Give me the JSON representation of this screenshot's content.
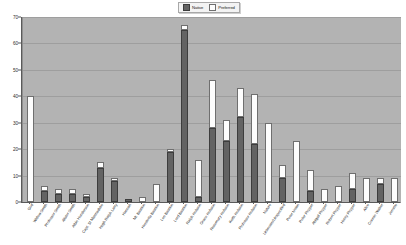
{
  "chart_data": {
    "type": "bar",
    "subtype": "stacked-vertical",
    "title": "",
    "xlabel": "",
    "ylabel": "",
    "ylim": [
      0,
      70
    ],
    "yticks": [
      0,
      10,
      20,
      30,
      40,
      50,
      60,
      70
    ],
    "grid": true,
    "legend_position": "top-center",
    "legend": [
      "Native",
      "Preferred"
    ],
    "categories": [
      "God",
      "Widow Smith",
      "Professor Smith",
      "Alister Smith",
      "Albie Henderson",
      "Capt. St Marmaduke",
      "Hugh Ralph Larry",
      "Hannah",
      "Mr. Bastion",
      "Henrietta Bastion",
      "Len Bastion",
      "Lord Bastion",
      "Ralph Hobson",
      "Grace Hobson",
      "Rosemary Hobson",
      "Keith Hobson",
      "Professor Hobson",
      "Nature",
      "Unknown/Unspecified",
      "Peter Nolan",
      "Peter Pepper",
      "Abigail Pepper",
      "Robert Pepper",
      "Henry Pepper",
      "Alice",
      "Connie Walker",
      "Jerome"
    ],
    "series": [
      {
        "name": "Native",
        "color": "#636363",
        "values": [
          0,
          4,
          3,
          3,
          2,
          13,
          8,
          1,
          0,
          0,
          19,
          65,
          2,
          28,
          23,
          32,
          22,
          0,
          9,
          0,
          4,
          0,
          0,
          5,
          0,
          7,
          0
        ]
      },
      {
        "name": "Preferred",
        "color": "#fdfdfd",
        "values": [
          40,
          2,
          2,
          2,
          1,
          2,
          1,
          0,
          2,
          7,
          1,
          2,
          14,
          18,
          8,
          11,
          19,
          30,
          5,
          23,
          8,
          5,
          6,
          6,
          9,
          2,
          9
        ]
      }
    ],
    "totals": [
      40,
      6,
      5,
      5,
      3,
      15,
      9,
      1,
      2,
      7,
      20,
      67,
      16,
      46,
      31,
      43,
      41,
      30,
      14,
      23,
      12,
      5,
      6,
      11,
      9,
      9,
      9
    ]
  },
  "colors": {
    "plot_background": "#b3b3b3",
    "page_background": "#ffffff",
    "gridline": "#9e9e9e",
    "axis": "#5a5a5a",
    "native": "#636363",
    "preferred": "#fdfdfd",
    "legend_background": "#f3f3f3",
    "legend_border": "#a8a8a8"
  }
}
